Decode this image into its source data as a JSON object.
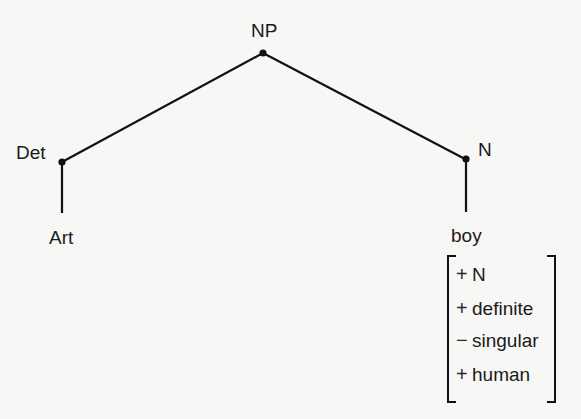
{
  "diagram": {
    "type": "syntactic-tree",
    "nodes": {
      "root": {
        "label": "NP"
      },
      "left": {
        "label": "Det"
      },
      "left_leaf": {
        "label": "Art"
      },
      "right": {
        "label": "N"
      },
      "right_leaf": {
        "label": "boy"
      }
    },
    "edges": [
      {
        "from": "NP",
        "to": "Det"
      },
      {
        "from": "NP",
        "to": "N"
      },
      {
        "from": "Det",
        "to": "Art"
      },
      {
        "from": "N",
        "to": "boy"
      }
    ],
    "feature_matrix": {
      "attached_to": "boy",
      "features": [
        {
          "sign": "+",
          "name": "N"
        },
        {
          "sign": "+",
          "name": "definite"
        },
        {
          "sign": "−",
          "name": "singular"
        },
        {
          "sign": "+",
          "name": "human"
        }
      ]
    },
    "colors": {
      "background": "#f7f7f5",
      "ink": "#1a1a1a"
    }
  }
}
